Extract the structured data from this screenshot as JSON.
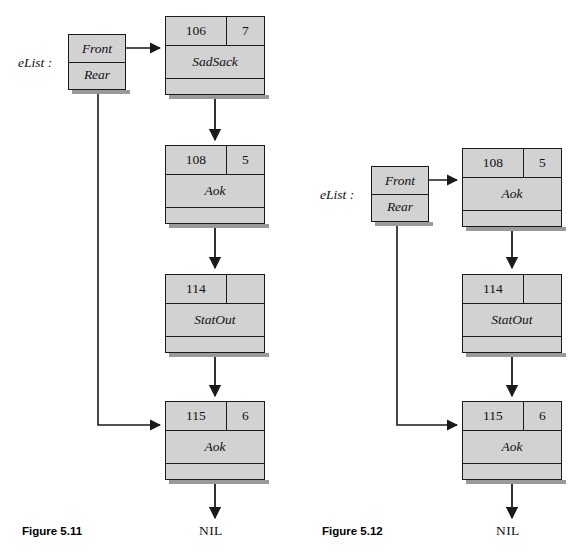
{
  "page": {
    "background": "#ffffff",
    "node_fill": "#d2d2d2",
    "stroke": "#1a1a1a"
  },
  "figures": [
    {
      "id": "figure-5-11",
      "caption": "Figure 5.11",
      "nil_label": "NIL",
      "header": {
        "label": "eList :",
        "front_label": "Front",
        "rear_label": "Rear"
      },
      "nodes": [
        {
          "key": "106",
          "count": "7",
          "name": "SadSack"
        },
        {
          "key": "108",
          "count": "5",
          "name": "Aok"
        },
        {
          "key": "114",
          "count": "",
          "name": "StatOut"
        },
        {
          "key": "115",
          "count": "6",
          "name": "Aok"
        }
      ]
    },
    {
      "id": "figure-5-12",
      "caption": "Figure 5.12",
      "nil_label": "NIL",
      "header": {
        "label": "eList :",
        "front_label": "Front",
        "rear_label": "Rear"
      },
      "nodes": [
        {
          "key": "108",
          "count": "5",
          "name": "Aok"
        },
        {
          "key": "114",
          "count": "",
          "name": "StatOut"
        },
        {
          "key": "115",
          "count": "6",
          "name": "Aok"
        }
      ]
    }
  ]
}
